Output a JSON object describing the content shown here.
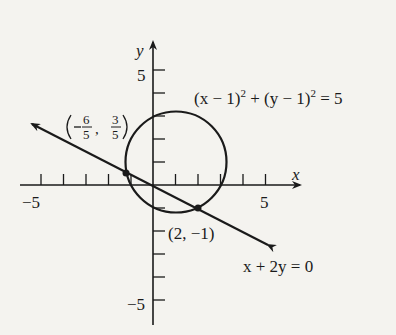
{
  "figure": {
    "axes": {
      "x_label": "x",
      "y_label": "y",
      "x_ticks": {
        "min": -5,
        "max": 5,
        "labeled": [
          "-5",
          "5"
        ]
      },
      "y_ticks": {
        "min": -5,
        "max": 5,
        "labeled": [
          "5",
          "-5"
        ]
      }
    },
    "circle": {
      "equation": "(x − 1)² + (y − 1)² = 5",
      "center": [
        1,
        1
      ],
      "radius_squared": 5
    },
    "line": {
      "equation": "x + 2y = 0"
    },
    "intersections": [
      {
        "label": "(−6/5, 3/5)",
        "x": -1.2,
        "y": 0.6
      },
      {
        "label": "(2, −1)",
        "x": 2,
        "y": -1
      }
    ],
    "labels": {
      "circle_eq_a": "(x − 1)",
      "circle_eq_b": "2",
      "circle_eq_c": " + (y − 1)",
      "circle_eq_d": "2",
      "circle_eq_e": " = 5",
      "line_eq": "x + 2y = 0",
      "point2": "(2, −1)",
      "point1_num1": "6",
      "point1_den1": "5",
      "point1_num2": "3",
      "point1_den2": "5",
      "x_axis": "x",
      "y_axis": "y",
      "tick_x_neg5": "−5",
      "tick_x_5": "5",
      "tick_y_5": "5",
      "tick_y_neg5": "−5"
    }
  }
}
